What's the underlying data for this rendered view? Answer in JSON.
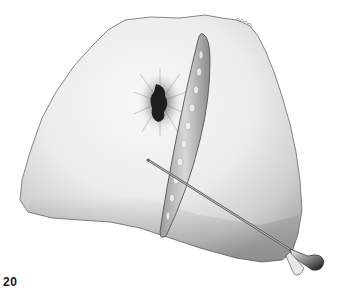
{
  "figure": {
    "number": "20",
    "elements": {
      "tissue": "triangular tissue specimen with ragged edges",
      "lesion": "dark oval lesion with radiating spicules",
      "parasite": "elongated spindle-shaped parasite with mottled interior",
      "probe": "thin needle-like probe with flared dark handle"
    },
    "colors": {
      "background": "#ffffff",
      "tissue_light": "#f2f2f2",
      "tissue_shadow": "#b8b8b8",
      "outline": "#6a6a6a",
      "lesion_core": "#1e1e1e",
      "probe_handle": "#2a2a2a"
    }
  }
}
